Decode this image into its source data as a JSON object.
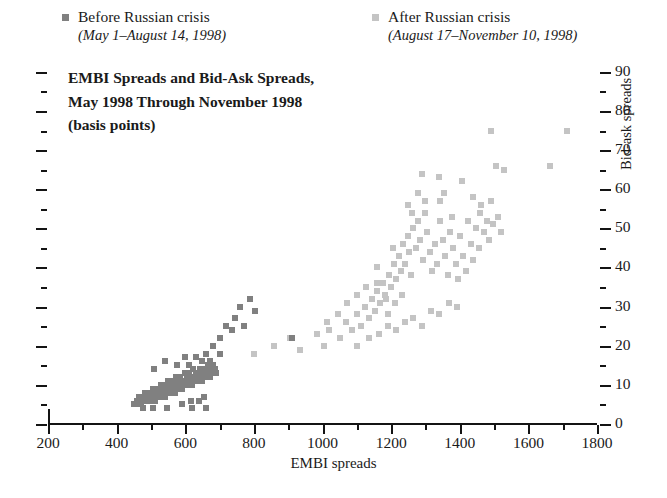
{
  "legend": {
    "before": {
      "label": "Before Russian crisis",
      "period": "(May 1–August 14, 1998)",
      "color": "#808080",
      "swatch_icon": "square-swatch-icon"
    },
    "after": {
      "label": "After Russian crisis",
      "period": "(August 17–November 10, 1998)",
      "color": "#c4c4c4",
      "swatch_icon": "square-swatch-icon"
    }
  },
  "title": {
    "line1": "EMBI Spreads and Bid-Ask Spreads,",
    "line2": "May 1998 Through November 1998",
    "line3": "(basis points)"
  },
  "chart_data": {
    "type": "scatter",
    "title": "EMBI Spreads and Bid-Ask Spreads, May 1998 Through November 1998 (basis points)",
    "xlabel": "EMBI spreads",
    "ylabel": "Bid-ask spreads",
    "xlim": [
      200,
      1800
    ],
    "ylim": [
      0,
      92
    ],
    "xticks": [
      200,
      400,
      600,
      800,
      1000,
      1200,
      1400,
      1600,
      1800
    ],
    "xtick_labels": [
      "200",
      "400",
      "600",
      "800",
      "1000",
      "1200",
      "1400",
      "1600",
      "1800"
    ],
    "x_minor_interval": 100,
    "yticks": [
      0,
      10,
      20,
      30,
      40,
      50,
      60,
      70,
      80,
      90
    ],
    "ytick_labels": [
      "0",
      "10",
      "20",
      "30",
      "40",
      "50",
      "60",
      "70",
      "80",
      "90"
    ],
    "y_minor_interval": 5,
    "y_axis_position": "right",
    "grid": false,
    "legend_position": "top",
    "marker": "square",
    "series": [
      {
        "name": "Before Russian crisis",
        "period": "(May 1–August 14, 1998)",
        "color": "#808080",
        "points": [
          [
            452,
            5
          ],
          [
            458,
            6
          ],
          [
            462,
            5
          ],
          [
            466,
            7
          ],
          [
            470,
            6
          ],
          [
            472,
            5
          ],
          [
            476,
            7
          ],
          [
            478,
            6
          ],
          [
            482,
            8
          ],
          [
            484,
            6
          ],
          [
            486,
            7
          ],
          [
            490,
            6
          ],
          [
            492,
            8
          ],
          [
            494,
            7
          ],
          [
            498,
            6
          ],
          [
            500,
            8
          ],
          [
            502,
            7
          ],
          [
            505,
            9
          ],
          [
            508,
            7
          ],
          [
            510,
            8
          ],
          [
            512,
            6
          ],
          [
            515,
            9
          ],
          [
            518,
            8
          ],
          [
            520,
            7
          ],
          [
            522,
            9
          ],
          [
            525,
            8
          ],
          [
            528,
            7
          ],
          [
            530,
            10
          ],
          [
            532,
            8
          ],
          [
            535,
            9
          ],
          [
            538,
            8
          ],
          [
            540,
            7
          ],
          [
            542,
            10
          ],
          [
            545,
            9
          ],
          [
            548,
            8
          ],
          [
            550,
            11
          ],
          [
            552,
            9
          ],
          [
            555,
            8
          ],
          [
            558,
            10
          ],
          [
            560,
            9
          ],
          [
            562,
            11
          ],
          [
            565,
            9
          ],
          [
            568,
            10
          ],
          [
            570,
            8
          ],
          [
            572,
            12
          ],
          [
            575,
            10
          ],
          [
            578,
            9
          ],
          [
            580,
            11
          ],
          [
            582,
            10
          ],
          [
            585,
            12
          ],
          [
            588,
            10
          ],
          [
            590,
            9
          ],
          [
            592,
            11
          ],
          [
            595,
            10
          ],
          [
            598,
            13
          ],
          [
            600,
            11
          ],
          [
            602,
            10
          ],
          [
            605,
            12
          ],
          [
            608,
            11
          ],
          [
            610,
            10
          ],
          [
            612,
            13
          ],
          [
            615,
            11
          ],
          [
            618,
            12
          ],
          [
            620,
            10
          ],
          [
            622,
            14
          ],
          [
            625,
            12
          ],
          [
            628,
            11
          ],
          [
            630,
            13
          ],
          [
            632,
            12
          ],
          [
            635,
            11
          ],
          [
            638,
            13
          ],
          [
            640,
            12
          ],
          [
            642,
            14
          ],
          [
            645,
            12
          ],
          [
            648,
            13
          ],
          [
            650,
            11
          ],
          [
            652,
            14
          ],
          [
            655,
            13
          ],
          [
            658,
            12
          ],
          [
            660,
            14
          ],
          [
            662,
            13
          ],
          [
            665,
            15
          ],
          [
            668,
            13
          ],
          [
            670,
            14
          ],
          [
            672,
            12
          ],
          [
            675,
            14
          ],
          [
            678,
            13
          ],
          [
            680,
            15
          ],
          [
            682,
            14
          ],
          [
            685,
            13
          ],
          [
            688,
            14
          ],
          [
            690,
            13
          ],
          [
            510,
            14
          ],
          [
            540,
            16
          ],
          [
            575,
            15
          ],
          [
            600,
            17
          ],
          [
            612,
            15
          ],
          [
            630,
            17
          ],
          [
            648,
            16
          ],
          [
            660,
            18
          ],
          [
            672,
            16
          ],
          [
            590,
            5
          ],
          [
            618,
            6
          ],
          [
            640,
            6
          ],
          [
            655,
            7
          ],
          [
            682,
            20
          ],
          [
            700,
            22
          ],
          [
            718,
            25
          ],
          [
            735,
            24
          ],
          [
            745,
            27
          ],
          [
            760,
            30
          ],
          [
            772,
            25
          ],
          [
            790,
            32
          ],
          [
            802,
            29
          ],
          [
            700,
            18
          ],
          [
            660,
            4
          ],
          [
            620,
            4
          ],
          [
            548,
            4
          ],
          [
            505,
            4
          ],
          [
            478,
            4
          ],
          [
            912,
            22
          ]
        ]
      },
      {
        "name": "After Russian crisis",
        "period": "(August 17–November 10, 1998)",
        "color": "#c4c4c4",
        "points": [
          [
            800,
            18
          ],
          [
            860,
            20
          ],
          [
            905,
            22
          ],
          [
            935,
            19
          ],
          [
            1005,
            20
          ],
          [
            1020,
            24
          ],
          [
            1050,
            22
          ],
          [
            1068,
            26
          ],
          [
            1085,
            24
          ],
          [
            1100,
            28
          ],
          [
            1112,
            25
          ],
          [
            1125,
            30
          ],
          [
            1135,
            27
          ],
          [
            1145,
            32
          ],
          [
            1152,
            29
          ],
          [
            1160,
            34
          ],
          [
            1168,
            31
          ],
          [
            1175,
            36
          ],
          [
            1182,
            33
          ],
          [
            1190,
            28
          ],
          [
            1195,
            38
          ],
          [
            1200,
            35
          ],
          [
            1208,
            41
          ],
          [
            1215,
            37
          ],
          [
            1222,
            43
          ],
          [
            1228,
            39
          ],
          [
            1235,
            46
          ],
          [
            1240,
            41
          ],
          [
            1248,
            48
          ],
          [
            1252,
            44
          ],
          [
            1258,
            38
          ],
          [
            1265,
            50
          ],
          [
            1272,
            45
          ],
          [
            1278,
            52
          ],
          [
            1285,
            47
          ],
          [
            1292,
            42
          ],
          [
            1298,
            54
          ],
          [
            1305,
            49
          ],
          [
            1312,
            44
          ],
          [
            1320,
            39
          ],
          [
            1328,
            46
          ],
          [
            1335,
            41
          ],
          [
            1342,
            52
          ],
          [
            1350,
            47
          ],
          [
            1358,
            43
          ],
          [
            1365,
            38
          ],
          [
            1372,
            49
          ],
          [
            1380,
            45
          ],
          [
            1388,
            41
          ],
          [
            1395,
            37
          ],
          [
            1402,
            48
          ],
          [
            1410,
            43
          ],
          [
            1418,
            39
          ],
          [
            1425,
            52
          ],
          [
            1432,
            46
          ],
          [
            1440,
            42
          ],
          [
            1448,
            50
          ],
          [
            1455,
            45
          ],
          [
            1462,
            56
          ],
          [
            1470,
            49
          ],
          [
            1478,
            52
          ],
          [
            1485,
            47
          ],
          [
            1492,
            57
          ],
          [
            1498,
            51
          ],
          [
            1505,
            66
          ],
          [
            1512,
            53
          ],
          [
            1520,
            49
          ],
          [
            1100,
            20
          ],
          [
            1135,
            22
          ],
          [
            1165,
            23
          ],
          [
            1190,
            25
          ],
          [
            1215,
            24
          ],
          [
            1240,
            26
          ],
          [
            1265,
            27
          ],
          [
            1290,
            25
          ],
          [
            1315,
            29
          ],
          [
            1340,
            28
          ],
          [
            1368,
            31
          ],
          [
            1392,
            30
          ],
          [
            1160,
            40
          ],
          [
            1205,
            45
          ],
          [
            1250,
            56
          ],
          [
            1262,
            54
          ],
          [
            1278,
            59
          ],
          [
            1298,
            57
          ],
          [
            1342,
            57
          ],
          [
            1355,
            59
          ],
          [
            1378,
            53
          ],
          [
            1440,
            58
          ],
          [
            1458,
            54
          ],
          [
            1290,
            64
          ],
          [
            1340,
            63
          ],
          [
            1408,
            62
          ],
          [
            1492,
            75
          ],
          [
            1528,
            65
          ],
          [
            1662,
            66
          ],
          [
            1712,
            75
          ],
          [
            1100,
            33
          ],
          [
            1128,
            35
          ],
          [
            1158,
            36
          ],
          [
            1185,
            32
          ],
          [
            1210,
            31
          ],
          [
            1232,
            33
          ],
          [
            1045,
            28
          ],
          [
            1070,
            31
          ],
          [
            985,
            23
          ],
          [
            1012,
            26
          ]
        ]
      }
    ]
  }
}
